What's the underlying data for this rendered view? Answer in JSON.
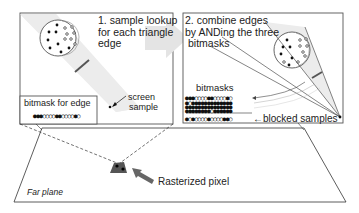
{
  "panel_left": {
    "title": "1. sample lookup\nfor each triangle\nedge",
    "title_lines": [
      "1. sample lookup",
      "for each triangle",
      "edge"
    ],
    "bitmask_label": "bitmask for edge",
    "bitmask": "●●●○○○○●●○○○○●○",
    "screen_sample_label_lines": [
      "screen",
      "sample"
    ]
  },
  "panel_right": {
    "title_lines": [
      "2. combine edges",
      "by ANDing the three",
      "bitmasks"
    ],
    "bitmasks_label": "bitmasks",
    "bitmask_rows": [
      "●●●○○○○●●○○○○●○",
      "●○●●●●●●●●●●●●●",
      "●●●●●●●●●●●●●●●",
      "●●●●●●●●○●●●●●●"
    ],
    "result_row": "●○●○○○○●○○○○●●○",
    "blocked_label": "blocked samples"
  },
  "far_plane": {
    "label": "Far plane",
    "pixel_label": "Rasterized pixel"
  },
  "colors": {
    "line": "#333333",
    "cone": "#e6e6e6",
    "box_border": "#555555",
    "arrow_fill": "#e4e4e4",
    "pixel_fill": "#555555"
  }
}
